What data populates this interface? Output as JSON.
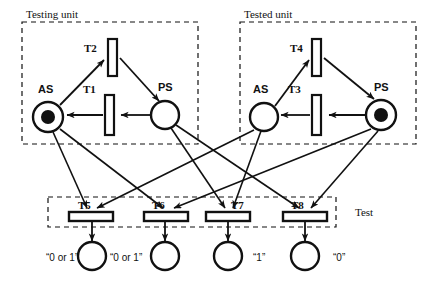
{
  "diagram": {
    "type": "petri-net",
    "width": 428,
    "height": 284,
    "colors": {
      "stroke": "#111111",
      "background": "#ffffff",
      "token": "#111111"
    },
    "groups": [
      {
        "id": "testing-unit",
        "label": "Testing unit",
        "x": 22,
        "y": 22,
        "w": 176,
        "h": 122,
        "label_x": 26,
        "label_y": 18
      },
      {
        "id": "tested-unit",
        "label": "Tested unit",
        "x": 240,
        "y": 22,
        "w": 176,
        "h": 122,
        "label_x": 244,
        "label_y": 18
      },
      {
        "id": "test",
        "label": "Test",
        "x": 48,
        "y": 197,
        "w": 288,
        "h": 30,
        "label_x": 355,
        "label_y": 215
      }
    ],
    "places": [
      {
        "id": "as-testing",
        "label": "AS",
        "cx": 48,
        "cy": 117,
        "r": 15,
        "marked": true,
        "tokens": 1,
        "label_x": 44,
        "label_y": 92,
        "value": ""
      },
      {
        "id": "ps-testing",
        "label": "PS",
        "cx": 165,
        "cy": 115,
        "r": 14,
        "marked": false,
        "tokens": 0,
        "label_x": 164,
        "label_y": 90,
        "value": ""
      },
      {
        "id": "as-tested",
        "label": "AS",
        "cx": 264,
        "cy": 117,
        "r": 14,
        "marked": false,
        "tokens": 0,
        "label_x": 258,
        "label_y": 92,
        "value": ""
      },
      {
        "id": "ps-tested",
        "label": "PS",
        "cx": 381,
        "cy": 115,
        "r": 15,
        "marked": true,
        "tokens": 1,
        "label_x": 381,
        "label_y": 90,
        "value": ""
      },
      {
        "id": "p5",
        "label": "",
        "cx": 92,
        "cy": 256,
        "r": 14,
        "marked": false,
        "tokens": 0,
        "value": "“0 or 1”",
        "value_x": 48,
        "value_y": 262
      },
      {
        "id": "p6",
        "label": "",
        "cx": 165,
        "cy": 256,
        "r": 14,
        "marked": false,
        "tokens": 0,
        "value": "“0 or 1”",
        "value_x": 122,
        "value_y": 262
      },
      {
        "id": "p7",
        "label": "",
        "cx": 228,
        "cy": 256,
        "r": 14,
        "marked": false,
        "tokens": 0,
        "value": "“1”",
        "value_x": 257,
        "value_y": 262
      },
      {
        "id": "p8",
        "label": "",
        "cx": 305,
        "cy": 256,
        "r": 14,
        "marked": false,
        "tokens": 0,
        "value": "“0”",
        "value_x": 337,
        "value_y": 262
      }
    ],
    "transitions": [
      {
        "id": "t1",
        "label": "T1",
        "orientation": "vertical",
        "x": 105,
        "y": 95,
        "w": 9,
        "h": 40,
        "label_x": 88,
        "label_y": 92
      },
      {
        "id": "t2",
        "label": "T2",
        "orientation": "vertical",
        "x": 108,
        "y": 39,
        "w": 9,
        "h": 37,
        "label_x": 90,
        "label_y": 51
      },
      {
        "id": "t3",
        "label": "T3",
        "orientation": "vertical",
        "x": 312,
        "y": 95,
        "w": 9,
        "h": 40,
        "label_x": 293,
        "label_y": 92
      },
      {
        "id": "t4",
        "label": "T4",
        "orientation": "vertical",
        "x": 312,
        "y": 39,
        "w": 9,
        "h": 37,
        "label_x": 295,
        "label_y": 51
      },
      {
        "id": "t5",
        "label": "T5",
        "orientation": "horizontal",
        "x": 68,
        "y": 212,
        "w": 44,
        "h": 9,
        "label_x": 82,
        "label_y": 208
      },
      {
        "id": "t6",
        "label": "T6",
        "orientation": "horizontal",
        "x": 145,
        "y": 212,
        "w": 44,
        "h": 9,
        "label_x": 157,
        "label_y": 208
      },
      {
        "id": "t7",
        "label": "T7",
        "orientation": "horizontal",
        "x": 206,
        "y": 212,
        "w": 44,
        "h": 9,
        "label_x": 233,
        "label_y": 208
      },
      {
        "id": "t8",
        "label": "T8",
        "orientation": "horizontal",
        "x": 283,
        "y": 212,
        "w": 44,
        "h": 9,
        "label_x": 296,
        "label_y": 208
      }
    ],
    "arcs": [
      {
        "id": "as-testing-to-t2",
        "from": "as-testing",
        "to": "t2",
        "points": "60,105 104,58"
      },
      {
        "id": "t2-to-ps-testing",
        "from": "t2",
        "to": "ps-testing",
        "points": "120,58 160,101"
      },
      {
        "id": "ps-testing-to-t1",
        "from": "ps-testing",
        "to": "t1",
        "points": "151,115 120,115"
      },
      {
        "id": "t1-to-as-testing",
        "from": "t1",
        "to": "as-testing",
        "points": "103,115 66,115"
      },
      {
        "id": "as-tested-to-t4",
        "from": "as-tested",
        "to": "t4",
        "points": "275,106 308,58"
      },
      {
        "id": "t4-to-ps-tested",
        "from": "t4",
        "to": "ps-tested",
        "points": "324,58 376,100"
      },
      {
        "id": "ps-tested-to-t3",
        "from": "ps-tested",
        "to": "t3",
        "points": "366,115 327,115"
      },
      {
        "id": "t3-to-as-tested",
        "from": "t3",
        "to": "as-tested",
        "points": "310,115 280,115"
      },
      {
        "id": "as-testing-to-t5",
        "from": "as-testing",
        "to": "t5",
        "points": "55,131 88,209"
      },
      {
        "id": "as-testing-to-t6",
        "from": "as-testing",
        "to": "t6",
        "points": "60,128 165,209"
      },
      {
        "id": "ps-testing-to-t7",
        "from": "ps-testing",
        "to": "t7",
        "points": "172,128 226,209"
      },
      {
        "id": "ps-testing-to-t8",
        "from": "ps-testing",
        "to": "t8",
        "points": "176,125 300,209"
      },
      {
        "id": "as-tested-to-t5b",
        "from": "as-tested",
        "to": "t5",
        "points": "255,130 96,209"
      },
      {
        "id": "as-tested-to-t7b",
        "from": "as-tested",
        "to": "t7",
        "points": "262,132 232,209"
      },
      {
        "id": "ps-tested-to-t6b",
        "from": "ps-tested",
        "to": "t6",
        "points": "372,129 173,209"
      },
      {
        "id": "ps-tested-to-t8b",
        "from": "ps-tested",
        "to": "t8",
        "points": "378,131 310,209"
      },
      {
        "id": "t5-to-p5",
        "from": "t5",
        "to": "p5",
        "points": "92,221 92,240"
      },
      {
        "id": "t6-to-p6",
        "from": "t6",
        "to": "p6",
        "points": "165,221 165,240"
      },
      {
        "id": "t7-to-p7",
        "from": "t7",
        "to": "p7",
        "points": "228,221 228,240"
      },
      {
        "id": "t8-to-p8",
        "from": "t8",
        "to": "p8",
        "points": "305,221 305,240"
      }
    ]
  }
}
